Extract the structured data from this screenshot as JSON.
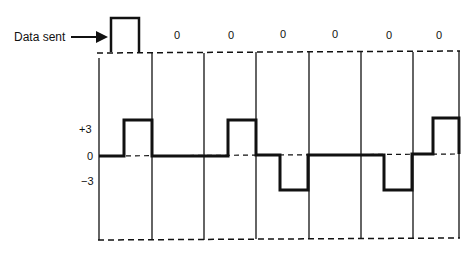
{
  "data_sent_label": "Data sent",
  "bits": [
    "1",
    "0",
    "0",
    "0",
    "0",
    "0",
    "0"
  ],
  "bit_labels": [
    "",
    "0",
    "0",
    "0",
    "0",
    "0",
    "0"
  ],
  "level_labels": {
    "plus": "+3",
    "zero": "0",
    "minus": "−3"
  },
  "signal_levels": [
    {
      "bit_index": 0,
      "first_half": 0,
      "second_half": 3
    },
    {
      "bit_index": 1,
      "first_half": 0,
      "second_half": 0
    },
    {
      "bit_index": 2,
      "first_half": 0,
      "second_half": 3
    },
    {
      "bit_index": 3,
      "first_half": 0,
      "second_half": -3
    },
    {
      "bit_index": 4,
      "first_half": 0,
      "second_half": 0
    },
    {
      "bit_index": 5,
      "first_half": 0,
      "second_half": -3
    },
    {
      "bit_index": 6,
      "first_half": 0,
      "second_half": 3
    }
  ],
  "colors": {
    "line": "#111111",
    "background": "#ffffff"
  }
}
